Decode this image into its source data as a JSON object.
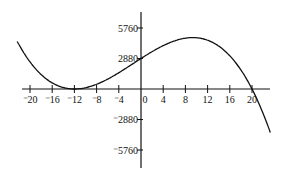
{
  "chart_data": {
    "type": "line",
    "title": "",
    "xlabel": "",
    "ylabel": "",
    "function": "f(x) = -(x+12)^2 (x-20)",
    "x_ticks": [
      -20,
      -16,
      -12,
      -8,
      -4,
      0,
      4,
      8,
      12,
      16,
      20
    ],
    "x_tick_labels": [
      "⁻20",
      "⁻16",
      "⁻12",
      "⁻8",
      "⁻4",
      "0",
      "4",
      "8",
      "12",
      "16",
      "20"
    ],
    "y_ticks": [
      5760,
      2880,
      -2880,
      -5760
    ],
    "y_tick_labels": [
      "5760",
      "2880",
      "⁻2880",
      "⁻5760"
    ],
    "xlim": [
      -22,
      23
    ],
    "ylim": [
      -6500,
      7000
    ],
    "grid": false,
    "series": [
      {
        "name": "curve",
        "color": "#111111",
        "x": [
          -22,
          -20,
          -16,
          -12,
          -8,
          -4,
          0,
          4,
          8,
          9.33,
          12,
          16,
          20,
          22.5
        ],
        "y": [
          4200,
          2560,
          576,
          0,
          448,
          1536,
          2880,
          4096,
          4800,
          4855,
          4096,
          3136,
          0,
          -1531
        ]
      }
    ],
    "annotations": {
      "min_point": [
        -12,
        0
      ],
      "max_point": [
        9.33,
        4855
      ],
      "x_intercepts": [
        -12,
        20
      ],
      "y_intercept": 2880
    }
  }
}
